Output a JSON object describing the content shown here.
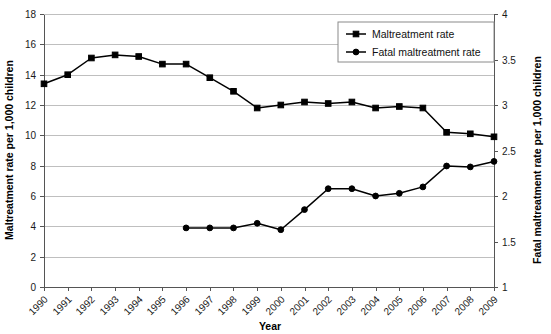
{
  "chart_data": {
    "type": "line",
    "title": "",
    "xlabel": "Year",
    "ylabel": "Maltreatment rate per 1,000 children",
    "y2label": "Fatal maltreatment rate per 1,000 children",
    "categories": [
      "1990",
      "1991",
      "1992",
      "1993",
      "1994",
      "1995",
      "1996",
      "1997",
      "1998",
      "1999",
      "2000",
      "2001",
      "2002",
      "2003",
      "2004",
      "2005",
      "2006",
      "2007",
      "2008",
      "2009"
    ],
    "ylim": [
      0,
      18
    ],
    "y2lim": [
      1,
      4
    ],
    "yticks": [
      "0",
      "2",
      "4",
      "6",
      "8",
      "10",
      "12",
      "14",
      "16",
      "18"
    ],
    "y2ticks": [
      "1",
      "1.5",
      "2",
      "2.5",
      "3",
      "3.5",
      "4"
    ],
    "grid": true,
    "legend_position": "top-right",
    "series": [
      {
        "name": "Maltreatment rate",
        "axis": "left",
        "marker": "square",
        "color": "#000000",
        "values": [
          13.4,
          14.0,
          15.1,
          15.3,
          15.2,
          14.7,
          14.7,
          13.8,
          12.9,
          11.8,
          12.0,
          12.2,
          12.1,
          12.2,
          11.8,
          11.9,
          11.8,
          10.2,
          10.1,
          9.9
        ]
      },
      {
        "name": "Fatal maltreatment rate",
        "axis": "right",
        "marker": "circle",
        "color": "#000000",
        "values": [
          null,
          null,
          null,
          null,
          null,
          null,
          1.65,
          1.65,
          1.65,
          1.7,
          1.63,
          1.85,
          2.08,
          2.08,
          2.0,
          2.03,
          2.1,
          2.33,
          2.32,
          2.38
        ],
        "values_left_scale": [
          null,
          null,
          null,
          null,
          null,
          null,
          3.4,
          3.4,
          3.4,
          3.6,
          3.35,
          4.1,
          5.8,
          5.8,
          5.4,
          5.6,
          5.9,
          7.5,
          7.45,
          7.8
        ]
      }
    ]
  },
  "legend": {
    "items": [
      {
        "label": "Maltreatment rate",
        "marker": "square"
      },
      {
        "label": "Fatal maltreatment rate",
        "marker": "circle"
      }
    ]
  }
}
